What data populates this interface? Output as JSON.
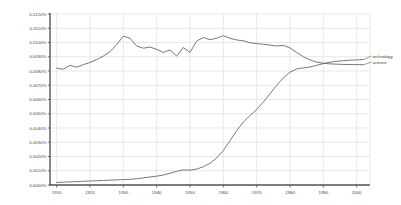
{
  "chart_data": {
    "type": "line",
    "title": "",
    "xlabel": "",
    "ylabel": "",
    "xlim": [
      1908,
      2004
    ],
    "ylim": [
      0.0,
      0.012
    ],
    "grid": true,
    "legend_position": "right-outside",
    "y_tick_labels": [
      "0.0120%",
      "0.0110%",
      "0.0100%",
      "0.0090%",
      "0.0080%",
      "0.0070%",
      "0.0060%",
      "0.0050%",
      "0.0040%",
      "0.0030%",
      "0.0020%",
      "0.0010%",
      "0.0000%"
    ],
    "y_tick_values": [
      0.012,
      0.011,
      0.01,
      0.009,
      0.008,
      0.007,
      0.006,
      0.005,
      0.004,
      0.003,
      0.002,
      0.001,
      0.0
    ],
    "x_tick_labels": [
      "1910",
      "1920",
      "1930",
      "1940",
      "1950",
      "1960",
      "1970",
      "1980",
      "1990",
      "2000"
    ],
    "x_tick_values": [
      1910,
      1920,
      1930,
      1940,
      1950,
      1960,
      1970,
      1980,
      1990,
      2000
    ],
    "x": [
      1910,
      1912,
      1914,
      1916,
      1918,
      1920,
      1922,
      1924,
      1926,
      1928,
      1930,
      1932,
      1934,
      1936,
      1938,
      1940,
      1942,
      1944,
      1946,
      1948,
      1950,
      1952,
      1954,
      1956,
      1958,
      1960,
      1962,
      1964,
      1966,
      1968,
      1970,
      1972,
      1974,
      1976,
      1978,
      1980,
      1982,
      1984,
      1986,
      1988,
      1990,
      1992,
      1994,
      1996,
      1998,
      2000,
      2002
    ],
    "series": [
      {
        "name": "science",
        "color": "#606060",
        "values": [
          0.0082,
          0.00812,
          0.0084,
          0.00826,
          0.00845,
          0.0086,
          0.0088,
          0.00905,
          0.00935,
          0.00985,
          0.01045,
          0.0103,
          0.00975,
          0.0096,
          0.00968,
          0.00952,
          0.0093,
          0.00948,
          0.00905,
          0.00965,
          0.0093,
          0.0101,
          0.01035,
          0.0102,
          0.0103,
          0.01048,
          0.0103,
          0.01018,
          0.01012,
          0.00998,
          0.00992,
          0.00988,
          0.00982,
          0.00975,
          0.0098,
          0.00962,
          0.0093,
          0.009,
          0.00878,
          0.00862,
          0.00855,
          0.0085,
          0.00848,
          0.00846,
          0.00845,
          0.00845,
          0.00844
        ]
      },
      {
        "name": "technology",
        "color": "#606060",
        "values": [
          0.00018,
          0.0002,
          0.00022,
          0.00024,
          0.00026,
          0.00028,
          0.0003,
          0.00032,
          0.00034,
          0.00036,
          0.00038,
          0.0004,
          0.00044,
          0.0005,
          0.00056,
          0.00062,
          0.0007,
          0.00082,
          0.00096,
          0.00106,
          0.00104,
          0.00112,
          0.00128,
          0.00152,
          0.0019,
          0.00242,
          0.0031,
          0.00382,
          0.00442,
          0.00488,
          0.0053,
          0.00582,
          0.0064,
          0.007,
          0.00752,
          0.00792,
          0.00815,
          0.00822,
          0.00828,
          0.0084,
          0.00852,
          0.00862,
          0.00868,
          0.00872,
          0.00876,
          0.00878,
          0.0088
        ]
      }
    ],
    "legend": [
      {
        "label": "technology"
      },
      {
        "label": "science"
      }
    ]
  }
}
